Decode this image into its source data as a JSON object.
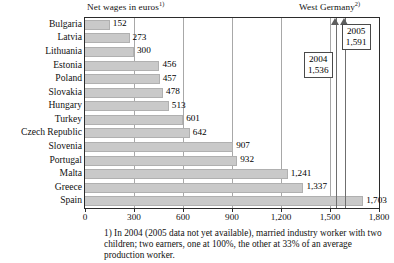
{
  "chart_data": {
    "type": "bar",
    "orientation": "horizontal",
    "title": "Net wages in euros",
    "title_superscript": "1)",
    "secondary_title": "West Germany",
    "secondary_title_superscript": "2)",
    "xlabel": "",
    "ylabel": "",
    "xlim": [
      0,
      1800
    ],
    "xticks": [
      0,
      300,
      600,
      900,
      1200,
      1500,
      1800
    ],
    "xtick_labels": [
      "0",
      "300",
      "600",
      "900",
      "1,200",
      "1,500",
      "1,800"
    ],
    "grid": true,
    "legend": "none",
    "bar_color": "#c9c9c9",
    "categories": [
      "Bulgaria",
      "Latvia",
      "Lithuania",
      "Estonia",
      "Poland",
      "Slovakia",
      "Hungary",
      "Turkey",
      "Czech Republic",
      "Slovenia",
      "Portugal",
      "Malta",
      "Greece",
      "Spain"
    ],
    "values": [
      152,
      273,
      300,
      456,
      457,
      478,
      513,
      601,
      642,
      907,
      932,
      1241,
      1337,
      1703
    ],
    "value_labels": [
      "152",
      "273",
      "300",
      "456",
      "457",
      "478",
      "513",
      "601",
      "642",
      "907",
      "932",
      "1,241",
      "1,337",
      "1,703"
    ],
    "reference_lines": [
      {
        "label_year": "2004",
        "label_value": "1,536",
        "value": 1536
      },
      {
        "label_year": "2005",
        "label_value": "1,591",
        "value": 1591
      }
    ],
    "footnotes": [
      "1) In 2004 (2005 data not yet available), married industry worker with two children; two earners, one at 100%, the other at 33% of an average production worker."
    ]
  }
}
